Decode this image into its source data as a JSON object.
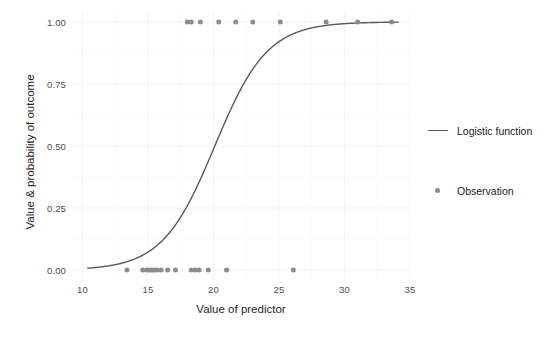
{
  "chart_data": {
    "type": "scatter",
    "title": "",
    "subtitle": "",
    "xlabel": "Value of predictor",
    "ylabel": "Value & probability of outcome",
    "xlim": [
      9.2,
      35.0
    ],
    "ylim": [
      -0.04,
      1.04
    ],
    "xticks": [
      10,
      15,
      20,
      25,
      30,
      35
    ],
    "xticklabels": [
      "10",
      "15",
      "20",
      "25",
      "30",
      "35"
    ],
    "yticks": [
      0.0,
      0.25,
      0.5,
      0.75,
      1.0
    ],
    "yticklabels": [
      "0.00",
      "0.25",
      "0.50",
      "0.75",
      "1.00"
    ],
    "grid": true,
    "grid_color": "#f2f2f2",
    "legend_position": "right",
    "series": [
      {
        "name": "Logistic function",
        "type": "line",
        "color": "#595959",
        "linewidth": 1.4,
        "model": "logistic",
        "intercept": -10.05,
        "slope": 0.5,
        "midpoint_x": 20.1,
        "x_start": 10.4,
        "x_end": 34.1,
        "points": [
          [
            10.4,
            0.007
          ],
          [
            11.0,
            0.01
          ],
          [
            12.0,
            0.016
          ],
          [
            13.0,
            0.026
          ],
          [
            14.0,
            0.043
          ],
          [
            15.0,
            0.069
          ],
          [
            16.0,
            0.11
          ],
          [
            17.0,
            0.172
          ],
          [
            18.0,
            0.258
          ],
          [
            18.5,
            0.311
          ],
          [
            19.0,
            0.369
          ],
          [
            19.5,
            0.431
          ],
          [
            20.0,
            0.494
          ],
          [
            20.5,
            0.556
          ],
          [
            21.0,
            0.617
          ],
          [
            21.5,
            0.674
          ],
          [
            22.0,
            0.726
          ],
          [
            23.0,
            0.811
          ],
          [
            24.0,
            0.875
          ],
          [
            25.0,
            0.919
          ],
          [
            26.0,
            0.949
          ],
          [
            27.0,
            0.968
          ],
          [
            28.0,
            0.98
          ],
          [
            29.0,
            0.988
          ],
          [
            30.0,
            0.993
          ],
          [
            31.0,
            0.996
          ],
          [
            32.0,
            0.997
          ],
          [
            33.0,
            0.998
          ],
          [
            34.1,
            0.999
          ]
        ]
      },
      {
        "name": "Observation",
        "type": "points",
        "color": "#8c8c8c",
        "marker_size": 5,
        "x": [
          13.4,
          14.6,
          14.9,
          15.1,
          15.3,
          15.5,
          15.7,
          16.0,
          16.5,
          17.1,
          18.3,
          18.6,
          18.9,
          19.6,
          21.0,
          18.0,
          18.3,
          19.0,
          20.4,
          21.7,
          23.0,
          25.1,
          28.6,
          31.0,
          33.6,
          26.1
        ],
        "y": [
          0,
          0,
          0,
          0,
          0,
          0,
          0,
          0,
          0,
          0,
          0,
          0,
          0,
          0,
          0,
          1,
          1,
          1,
          1,
          1,
          1,
          1,
          1,
          1,
          1,
          0
        ]
      }
    ]
  },
  "legend": {
    "entries": [
      {
        "label": "Logistic function",
        "key": "line-key",
        "color": "#595959"
      },
      {
        "label": "Observation",
        "key": "point-key",
        "color": "#8c8c8c"
      }
    ]
  },
  "axes": {
    "x_title": "Value of predictor",
    "y_title": "Value & probability of outcome"
  }
}
